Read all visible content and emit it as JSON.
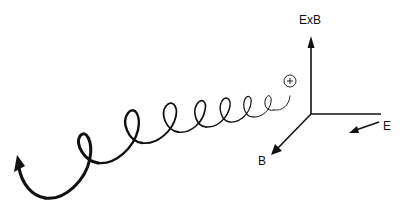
{
  "diagram": {
    "title": "",
    "labels": {
      "exb": "ExB",
      "b": "B",
      "e": "E"
    },
    "particle": {
      "symbol": "+",
      "shape": "circle"
    },
    "axes": [
      {
        "name": "ExB",
        "direction": "up"
      },
      {
        "name": "E",
        "direction": "right"
      },
      {
        "name": "B",
        "direction": "down-left"
      }
    ],
    "colors": {
      "stroke": "#111111",
      "background": "#ffffff"
    }
  }
}
